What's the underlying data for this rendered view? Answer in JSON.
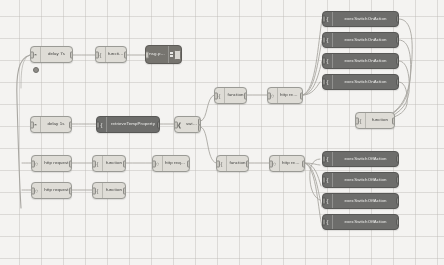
{
  "app": {
    "name": "Node-RED flow editor canvas",
    "canvas_background": "#f4f3f1",
    "grid_color": "#bebcb8",
    "node_light_color": "#dedcd6",
    "node_dark_color": "#6d6d6b",
    "wire_color": "#a9a7a2"
  },
  "nodes": {
    "delay_7s": {
      "label": "delay 7s",
      "icon": "clock-icon",
      "type": "delay"
    },
    "function_1": {
      "label": "function",
      "icon": "function-icon",
      "type": "function"
    },
    "debug_payload": {
      "label": "msg.payload",
      "icon": "debug-icon",
      "type": "debug"
    },
    "delay_1s": {
      "label": "delay 1s",
      "icon": "clock-icon",
      "type": "delay"
    },
    "retrieve_temp": {
      "label": "retrieveTempProperty",
      "icon": "function-icon",
      "type": "function"
    },
    "switch_1": {
      "label": "switch",
      "icon": "switch-icon",
      "type": "switch"
    },
    "function_2": {
      "label": "function",
      "icon": "function-icon",
      "type": "function"
    },
    "http_request_1": {
      "label": "http request",
      "icon": "globe-icon",
      "type": "http request"
    },
    "http_request_2": {
      "label": "http request",
      "icon": "globe-icon",
      "type": "http request"
    },
    "function_3": {
      "label": "function",
      "icon": "function-icon",
      "type": "function"
    },
    "http_request_3": {
      "label": "http request",
      "icon": "globe-icon",
      "type": "http request"
    },
    "http_request_4": {
      "label": "http request",
      "icon": "globe-icon",
      "type": "http request"
    },
    "function_4": {
      "label": "function",
      "icon": "function-icon",
      "type": "function"
    },
    "function_5": {
      "label": "function",
      "icon": "function-icon",
      "type": "function"
    },
    "http_request_5": {
      "label": "http request",
      "icon": "globe-icon",
      "type": "http request"
    },
    "function_out": {
      "label": "function",
      "icon": "function-icon",
      "type": "function"
    },
    "exec_top_1": {
      "label": "execSwitchOnAction",
      "icon": "function-icon",
      "type": "function"
    },
    "exec_top_2": {
      "label": "execSwitchOnAction",
      "icon": "function-icon",
      "type": "function"
    },
    "exec_top_3": {
      "label": "execSwitchOnAction",
      "icon": "function-icon",
      "type": "function"
    },
    "exec_top_4": {
      "label": "execSwitchOnAction",
      "icon": "function-icon",
      "type": "function"
    },
    "exec_bot_1": {
      "label": "execSwitchOffAction",
      "icon": "function-icon",
      "type": "function"
    },
    "exec_bot_2": {
      "label": "execSwitchOffAction",
      "icon": "function-icon",
      "type": "function"
    },
    "exec_bot_3": {
      "label": "execSwitchOffAction",
      "icon": "function-icon",
      "type": "function"
    },
    "exec_bot_4": {
      "label": "execSwitchOffAction",
      "icon": "function-icon",
      "type": "function"
    }
  },
  "glyphs": {
    "function": "{",
    "switch": "⑂",
    "globe": "○",
    "clock": "◔",
    "debug": "■"
  }
}
